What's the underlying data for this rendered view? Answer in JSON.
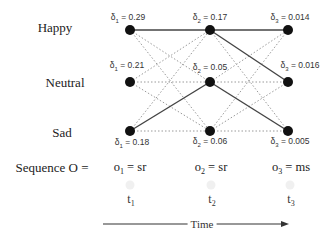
{
  "diagram": {
    "type": "viterbi-trellis",
    "states": [
      {
        "id": "happy",
        "label": "Happy"
      },
      {
        "id": "neutral",
        "label": "Neutral"
      },
      {
        "id": "sad",
        "label": "Sad"
      }
    ],
    "columns": [
      {
        "time": "t",
        "time_sub": "1",
        "observation": "o",
        "observation_sub": "1",
        "observation_value": " = sr",
        "deltas": [
          {
            "state": "happy",
            "sym": "δ",
            "sub": "1",
            "text": " = 0.29"
          },
          {
            "state": "neutral",
            "sym": "δ",
            "sub": "1",
            "text": " = 0.21"
          },
          {
            "state": "sad",
            "sym": "δ",
            "sub": "1",
            "text": " = 0.18"
          }
        ]
      },
      {
        "time": "t",
        "time_sub": "2",
        "observation": "o",
        "observation_sub": "2",
        "observation_value": " = sr",
        "deltas": [
          {
            "state": "happy",
            "sym": "δ",
            "sub": "2",
            "text": " = 0.17"
          },
          {
            "state": "neutral",
            "sym": "δ",
            "sub": "2",
            "text": " = 0.05"
          },
          {
            "state": "sad",
            "sym": "δ",
            "sub": "2",
            "text": " = 0.06"
          }
        ]
      },
      {
        "time": "t",
        "time_sub": "3",
        "observation": "o",
        "observation_sub": "3",
        "observation_value": " = ms",
        "deltas": [
          {
            "state": "happy",
            "sym": "δ",
            "sub": "3",
            "text": " = 0.014"
          },
          {
            "state": "neutral",
            "sym": "δ",
            "sub": "3",
            "text": " = 0.016"
          },
          {
            "state": "sad",
            "sym": "δ",
            "sub": "3",
            "text": " = 0.005"
          }
        ]
      }
    ],
    "best_transitions": [
      {
        "from": "happy@t1",
        "to": "happy@t2"
      },
      {
        "from": "sad@t1",
        "to": "neutral@t2"
      },
      {
        "from": "happy@t2",
        "to": "happy@t3"
      },
      {
        "from": "happy@t2",
        "to": "neutral@t3"
      },
      {
        "from": "neutral@t2",
        "to": "sad@t3"
      }
    ],
    "sequence_label": "Sequence O =",
    "time_axis_label": "Time",
    "colors": {
      "node": "#111111",
      "solid_edge": "#444444",
      "dotted_edge": "#9a9a9a"
    }
  }
}
